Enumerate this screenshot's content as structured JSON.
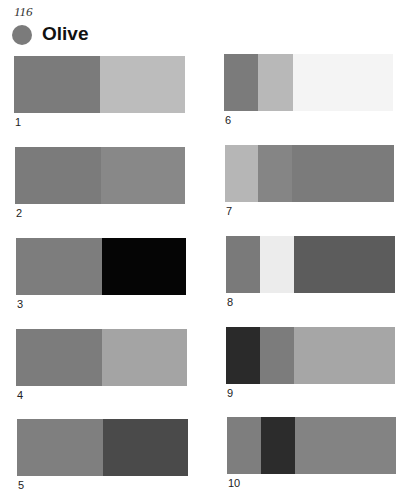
{
  "page": {
    "number": "116",
    "title": "Olive",
    "swatch_color": "#7b7b7b"
  },
  "combinations": [
    {
      "label": "1",
      "x": 14,
      "y": 56,
      "w": 171,
      "segments": [
        {
          "color": "#7b7b7b",
          "flex": 86
        },
        {
          "color": "#bcbcbc",
          "flex": 85
        }
      ]
    },
    {
      "label": "2",
      "x": 15,
      "y": 147,
      "w": 170,
      "segments": [
        {
          "color": "#7b7b7b",
          "flex": 86
        },
        {
          "color": "#888888",
          "flex": 84
        }
      ]
    },
    {
      "label": "3",
      "x": 16,
      "y": 238,
      "w": 170,
      "segments": [
        {
          "color": "#7d7d7d",
          "flex": 86
        },
        {
          "color": "#050505",
          "flex": 84
        }
      ]
    },
    {
      "label": "4",
      "x": 16,
      "y": 329,
      "w": 171,
      "segments": [
        {
          "color": "#7c7c7c",
          "flex": 86
        },
        {
          "color": "#a4a4a4",
          "flex": 85
        }
      ]
    },
    {
      "label": "5",
      "x": 17,
      "y": 419,
      "w": 171,
      "segments": [
        {
          "color": "#7f7f7f",
          "flex": 86
        },
        {
          "color": "#4a4a4a",
          "flex": 85
        }
      ]
    },
    {
      "label": "6",
      "x": 224,
      "y": 54,
      "w": 169,
      "segments": [
        {
          "color": "#7b7b7b",
          "flex": 34
        },
        {
          "color": "#b8b8b8",
          "flex": 35
        },
        {
          "color": "#f4f4f4",
          "flex": 100
        }
      ]
    },
    {
      "label": "7",
      "x": 225,
      "y": 145,
      "w": 169,
      "segments": [
        {
          "color": "#b6b6b6",
          "flex": 33
        },
        {
          "color": "#858585",
          "flex": 34
        },
        {
          "color": "#7b7b7b",
          "flex": 102
        }
      ]
    },
    {
      "label": "8",
      "x": 226,
      "y": 236,
      "w": 169,
      "segments": [
        {
          "color": "#7a7a7a",
          "flex": 34
        },
        {
          "color": "#ececec",
          "flex": 34
        },
        {
          "color": "#5c5c5c",
          "flex": 101
        }
      ]
    },
    {
      "label": "9",
      "x": 226,
      "y": 327,
      "w": 169,
      "segments": [
        {
          "color": "#2a2a2a",
          "flex": 34
        },
        {
          "color": "#7c7c7c",
          "flex": 34
        },
        {
          "color": "#a6a6a6",
          "flex": 101
        }
      ]
    },
    {
      "label": "10",
      "x": 227,
      "y": 417,
      "w": 169,
      "segments": [
        {
          "color": "#7e7e7e",
          "flex": 34
        },
        {
          "color": "#2c2c2c",
          "flex": 34
        },
        {
          "color": "#838383",
          "flex": 101
        }
      ]
    }
  ]
}
